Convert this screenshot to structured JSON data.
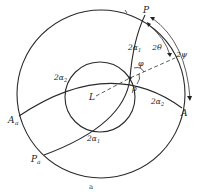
{
  "figure": {
    "caption": "a",
    "labels": {
      "P": "P",
      "A": "A",
      "A_a": "A",
      "A_a_sub": "a",
      "P_a": "P",
      "P_a_sub": "a",
      "L": "L",
      "two_alpha1_top": "2α",
      "two_alpha1_top_sub": "1",
      "two_alpha1_bottom": "2α",
      "two_alpha1_bottom_sub": "1",
      "two_alpha2_left": "2α",
      "two_alpha2_left_sub": "2",
      "two_alpha2_right": "2α",
      "two_alpha2_right_sub": "2",
      "two_theta": "2θ",
      "two_psi": "2ψ",
      "phi": "φ",
      "rho": "ρ"
    }
  }
}
